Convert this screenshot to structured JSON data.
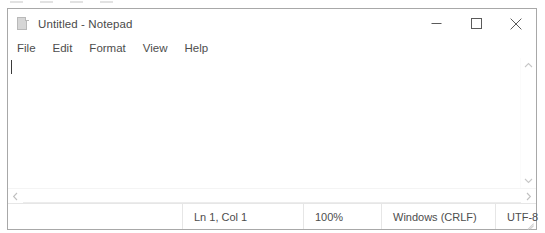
{
  "window": {
    "title": "Untitled - Notepad",
    "icon": "notepad-document-icon",
    "controls": {
      "minimize_label": "Minimize",
      "maximize_label": "Maximize",
      "close_label": "Close"
    }
  },
  "menubar": {
    "items": [
      {
        "label": "File"
      },
      {
        "label": "Edit"
      },
      {
        "label": "Format"
      },
      {
        "label": "View"
      },
      {
        "label": "Help"
      }
    ]
  },
  "editor": {
    "content": "",
    "placeholder": "",
    "caret_visible": true
  },
  "scrollbars": {
    "vertical": {
      "up_arrow": "chevron-up-icon",
      "down_arrow": "chevron-down-icon"
    },
    "horizontal": {
      "left_arrow": "chevron-left-icon",
      "right_arrow": "chevron-right-icon"
    }
  },
  "statusbar": {
    "cursor_position": "Ln 1, Col 1",
    "zoom": "100%",
    "line_ending": "Windows (CRLF)",
    "encoding": "UTF-8",
    "resize_grip": "resize-grip-icon"
  },
  "colors": {
    "window_background": "#ffffff",
    "window_border": "#a8a8a8",
    "text_primary": "#4a4a4a",
    "text_secondary": "#4d4d4d",
    "separator": "#e6e6e6",
    "icon_stroke": "#5a5a5a",
    "caret": "#3a3a3a"
  }
}
